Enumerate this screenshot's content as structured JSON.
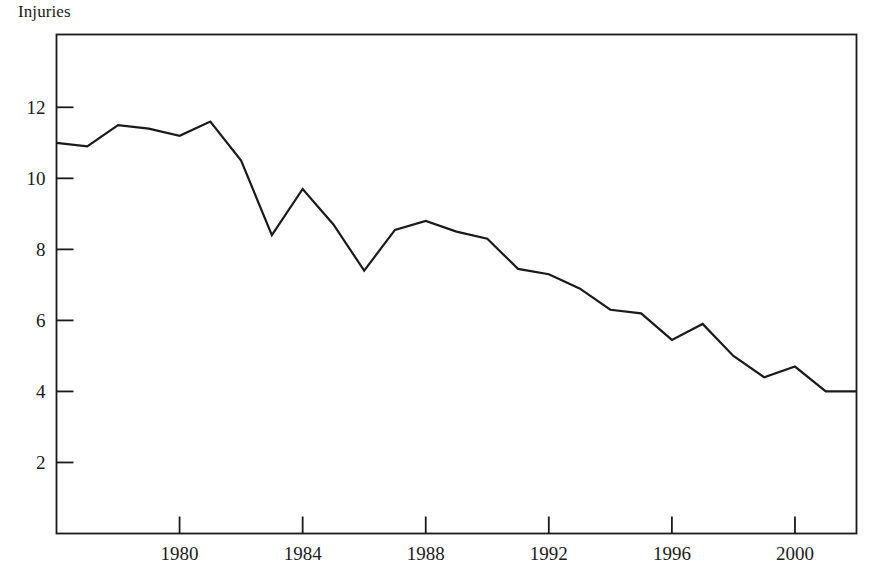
{
  "chart_data": {
    "type": "line",
    "title": "Injuries",
    "subtitle": "",
    "xlabel": "",
    "ylabel": "",
    "x": [
      1976,
      1977,
      1978,
      1979,
      1980,
      1981,
      1982,
      1983,
      1984,
      1985,
      1986,
      1987,
      1988,
      1989,
      1990,
      1991,
      1992,
      1993,
      1994,
      1995,
      1996,
      1997,
      1998,
      1999,
      2000,
      2001,
      2002
    ],
    "values": [
      11.0,
      10.9,
      11.5,
      11.4,
      11.2,
      11.6,
      10.5,
      8.4,
      9.7,
      8.7,
      7.4,
      8.55,
      8.8,
      8.5,
      8.3,
      7.45,
      7.3,
      6.9,
      6.3,
      6.2,
      5.45,
      5.9,
      5.0,
      4.4,
      4.7,
      4.0,
      4.0
    ],
    "series": [
      {
        "name": "Injuries",
        "values": [
          11.0,
          10.9,
          11.5,
          11.4,
          11.2,
          11.6,
          10.5,
          8.4,
          9.7,
          8.7,
          7.4,
          8.55,
          8.8,
          8.5,
          8.3,
          7.45,
          7.3,
          6.9,
          6.3,
          6.2,
          5.45,
          5.9,
          5.0,
          4.4,
          4.7,
          4.0,
          4.0
        ],
        "color": "#1a1a1a"
      }
    ],
    "xlim": [
      1976,
      2002
    ],
    "ylim": [
      0,
      14.05
    ],
    "x_ticks": [
      1980,
      1984,
      1988,
      1992,
      1996,
      2000
    ],
    "x_tick_labels": [
      "1980",
      "1984",
      "1988",
      "1992",
      "1996",
      "2000"
    ],
    "y_ticks": [
      2,
      4,
      6,
      8,
      10,
      12
    ],
    "y_tick_labels": [
      "2",
      "4",
      "6",
      "8",
      "10",
      "12"
    ],
    "grid": false,
    "legend": "none",
    "line_color": "#1a1a1a",
    "line_width": 2.2,
    "frame_color": "#1a1a1a"
  }
}
